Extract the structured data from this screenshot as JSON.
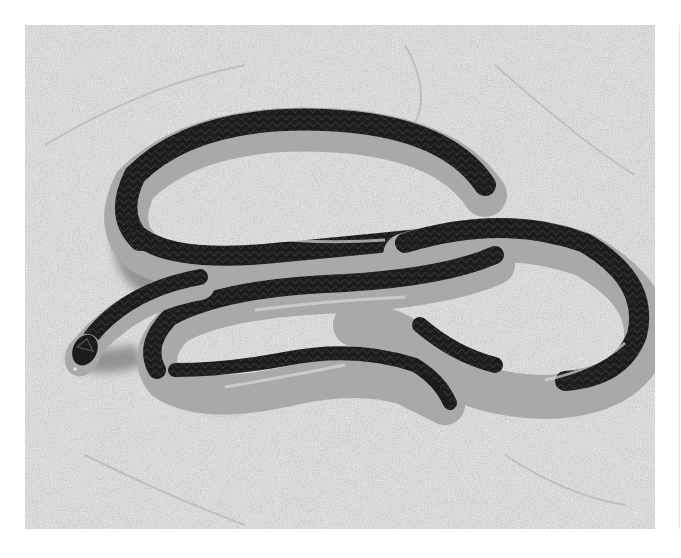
{
  "image": {
    "kind": "photograph",
    "subject": "striped snake coiled on sand",
    "alt": "Grayscale photo of a slender snake with a dark dorsal stripe and pale sides coiled on sandy ground",
    "colors": {
      "page_background": "#ffffff",
      "sand": "#c9c9c9",
      "sand_light": "#dedede",
      "sand_dark": "#8f8f8f",
      "snake_dark_stripe": "#1c1c1c",
      "snake_pale_body": "#a9a9a9",
      "snake_highlight": "#d8d8d8",
      "shadow": "#5a5a5a",
      "edge_line": "#e6e6e6"
    },
    "frame": {
      "x": 25,
      "y": 25,
      "width": 630,
      "height": 504
    }
  }
}
